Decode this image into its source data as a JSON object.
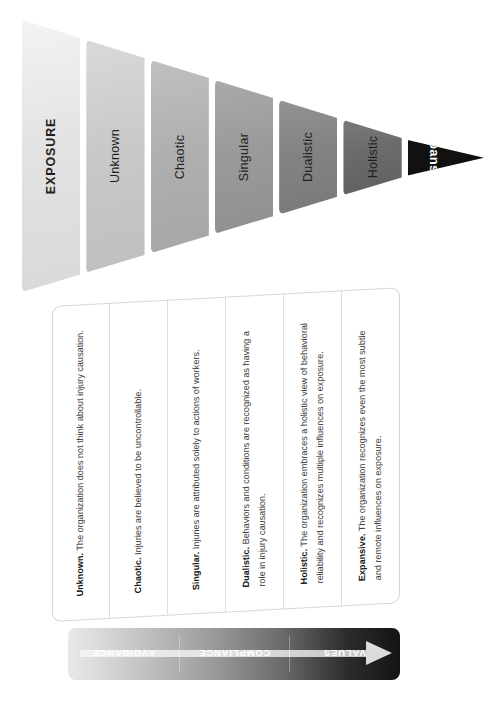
{
  "diagram": {
    "title": "EXPOSURE",
    "orientation": "rotated-90",
    "wedge": {
      "bands": [
        {
          "label": "EXPOSURE",
          "color": "#e3e3e3",
          "text_color": "#231f20"
        },
        {
          "label": "Unknown",
          "color": "#c9c9c9",
          "text_color": "#231f20"
        },
        {
          "label": "Chaotic",
          "color": "#b0b0b0",
          "text_color": "#231f20"
        },
        {
          "label": "Singular",
          "color": "#9a9a9a",
          "text_color": "#231f20"
        },
        {
          "label": "Dualistic",
          "color": "#838383",
          "text_color": "#231f20"
        },
        {
          "label": "Holistic",
          "color": "#6a6a6a",
          "text_color": "#231f20"
        },
        {
          "label": "Expansive",
          "color": "#111111",
          "text_color": "#ffffff"
        }
      ]
    },
    "panel": {
      "cells": [
        {
          "term": "Unknown.",
          "body": "The organization does not think about injury causation."
        },
        {
          "term": "Chaotic.",
          "body": "Injuries are believed to be uncontrollable."
        },
        {
          "term": "Singular.",
          "body": "Injuries are attributed solely to actions of workers."
        },
        {
          "term": "Dualistic.",
          "body": "Behaviors and conditions are recognized as having a role in injury causation."
        },
        {
          "term": "Holistic.",
          "body": "The organization embraces a holistic view of behavioral reliability and recognizes multiple influences on exposure."
        },
        {
          "term": "Expansive.",
          "body": "The organization recognizes even the most subtle and remote influences on exposure."
        }
      ]
    },
    "arrow_bar": {
      "zones": [
        {
          "label": "AVOIDANCE"
        },
        {
          "label": "COMPLIANCE"
        },
        {
          "label": "VALUES"
        }
      ],
      "arrow_direction": "right",
      "gradient_from": "#e9e9e9",
      "gradient_to": "#141414"
    }
  }
}
